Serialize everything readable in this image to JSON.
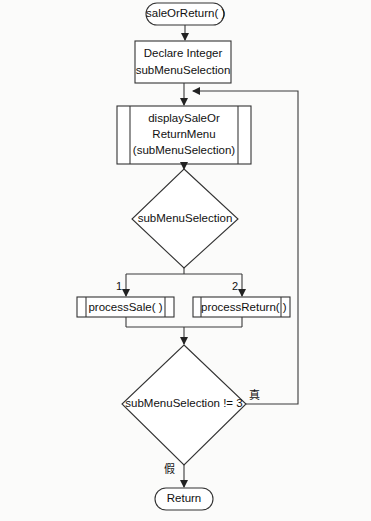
{
  "diagram": {
    "type": "flowchart",
    "nodes": {
      "start": {
        "shape": "terminal",
        "label": "saleOrReturn( )"
      },
      "declare": {
        "shape": "process",
        "line1": "Declare Integer",
        "line2": "subMenuSelection"
      },
      "display_menu": {
        "shape": "subprocess",
        "line1": "displaySaleOr",
        "line2": "ReturnMenu",
        "line3": "(subMenuSelection)"
      },
      "case_select": {
        "shape": "decision",
        "label": "subMenuSelection"
      },
      "process_sale": {
        "shape": "subprocess",
        "label": "processSale( )"
      },
      "process_return": {
        "shape": "subprocess",
        "label": "processReturn( )"
      },
      "loop_check": {
        "shape": "decision",
        "label": "subMenuSelection != 3"
      },
      "end": {
        "shape": "terminal",
        "label": "Return"
      }
    },
    "edges": {
      "case_1": "1",
      "case_2": "2",
      "true_label": "真",
      "false_label": "假"
    },
    "colors": {
      "stroke": "#333333",
      "fill": "#ffffff",
      "background": "#fbfbfa"
    }
  }
}
